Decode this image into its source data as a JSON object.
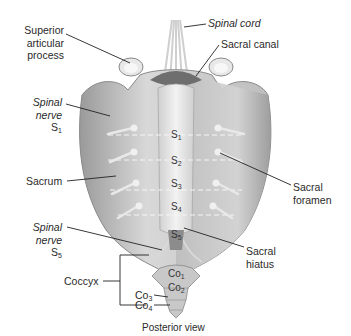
{
  "figure": {
    "caption": "Posterior view",
    "labels": {
      "superior_articular_process": [
        "Superior",
        "articular",
        "process"
      ],
      "spinal_cord": "Spinal cord",
      "sacral_canal": "Sacral canal",
      "spinal_nerve_s1": {
        "line1": "Spinal",
        "line2": "nerve",
        "seg": "S",
        "sub": "1"
      },
      "sacrum": "Sacrum",
      "sacral_foramen": [
        "Sacral",
        "foramen"
      ],
      "spinal_nerve_s5": {
        "line1": "Spinal",
        "line2": "nerve",
        "seg": "S",
        "sub": "5"
      },
      "sacral_hiatus": [
        "Sacral",
        "hiatus"
      ],
      "coccyx": "Coccyx",
      "co3": {
        "seg": "Co",
        "sub": "3"
      },
      "co4": {
        "seg": "Co",
        "sub": "4"
      }
    },
    "segments": [
      {
        "seg": "S",
        "sub": "1"
      },
      {
        "seg": "S",
        "sub": "2"
      },
      {
        "seg": "S",
        "sub": "3"
      },
      {
        "seg": "S",
        "sub": "4"
      },
      {
        "seg": "S",
        "sub": "5"
      },
      {
        "seg": "Co",
        "sub": "1"
      },
      {
        "seg": "Co",
        "sub": "2"
      }
    ],
    "colors": {
      "bone_light": "#e6e6e6",
      "bone_mid": "#c4c4c4",
      "bone_dark": "#8e8e8e",
      "line": "#222222"
    }
  }
}
